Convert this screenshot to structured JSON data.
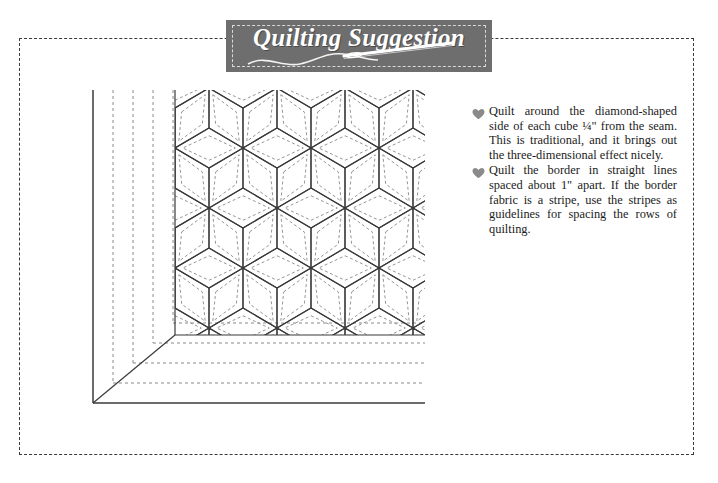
{
  "page": {
    "background_color": "#ffffff",
    "width": 718,
    "height": 483
  },
  "frame": {
    "name": "dashed-page-border",
    "style": "dashed",
    "color": "#3a3a3a"
  },
  "banner": {
    "title": "Quilting Suggestion",
    "background_color": "#6e6e6e",
    "inner_border_color": "#d9d9d9",
    "text_color": "#ffffff",
    "ornament": "needle-and-thread"
  },
  "instructions": {
    "bullet_icon": "heart-icon",
    "bullet_color": "#8a8a8a",
    "items": [
      "Quilt around the diamond-shaped side of each cube ¼\" from the seam. This is traditional, and it brings out the three-dimensional effect nicely.",
      "Quilt the border in straight lines spaced about 1\" apart. If the border fabric is a stripe, use the stripes as guidelines for spacing the rows of quilting."
    ]
  },
  "diagram": {
    "name": "quilting-layout-diagram",
    "solid_line_color": "#3a3a3a",
    "dashed_line_color": "#8a8a8a",
    "border": {
      "quilting_lines_vertical": 4,
      "quilting_lines_horizontal": 4,
      "spacing_px": 20,
      "miter_corner": true
    },
    "blocks": {
      "pattern": "tumbling-blocks",
      "rhombus_half_width": 34,
      "rhombus_half_height": 20,
      "columns": 4,
      "rows": 3,
      "quilting_inset_px": 5
    }
  }
}
